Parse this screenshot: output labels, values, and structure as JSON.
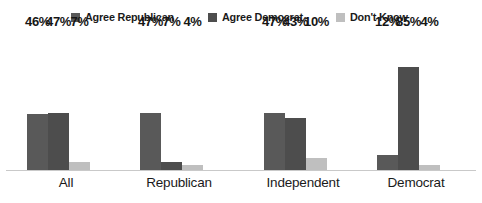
{
  "chart_data": {
    "type": "bar",
    "title": "",
    "subtitle": "",
    "xlabel": "",
    "ylabel": "",
    "ylim": [
      0,
      100
    ],
    "grid": false,
    "legend_position": "top-center",
    "value_label_suffix": "%",
    "categories": [
      "All",
      "Republican",
      "Independent",
      "Democrat"
    ],
    "series": [
      {
        "name": "Agree Republican",
        "color": "#595959",
        "values": [
          46,
          47,
          47,
          12
        ],
        "labels": [
          "46%",
          "47%",
          "47%",
          "12%"
        ]
      },
      {
        "name": "Agree Democrat",
        "color": "#4d4d4d",
        "values": [
          47,
          7,
          43,
          85
        ],
        "labels": [
          "47%",
          "7%",
          "43%",
          "85%"
        ]
      },
      {
        "name": "Don't Know",
        "color": "#bfbfbf",
        "values": [
          7,
          4,
          10,
          4
        ],
        "labels": [
          "7%",
          "4%",
          "10%",
          "4%"
        ]
      }
    ]
  },
  "legend": {
    "items": [
      {
        "label": "Agree Republican",
        "color": "#595959",
        "icon": "square-swatch-icon"
      },
      {
        "label": "Agree Democrat",
        "color": "#4d4d4d",
        "icon": "square-swatch-icon"
      },
      {
        "label": "Don't Know",
        "color": "#bfbfbf",
        "icon": "square-swatch-icon"
      }
    ]
  },
  "axis": {
    "baseline_color": "#c9c9c9"
  }
}
